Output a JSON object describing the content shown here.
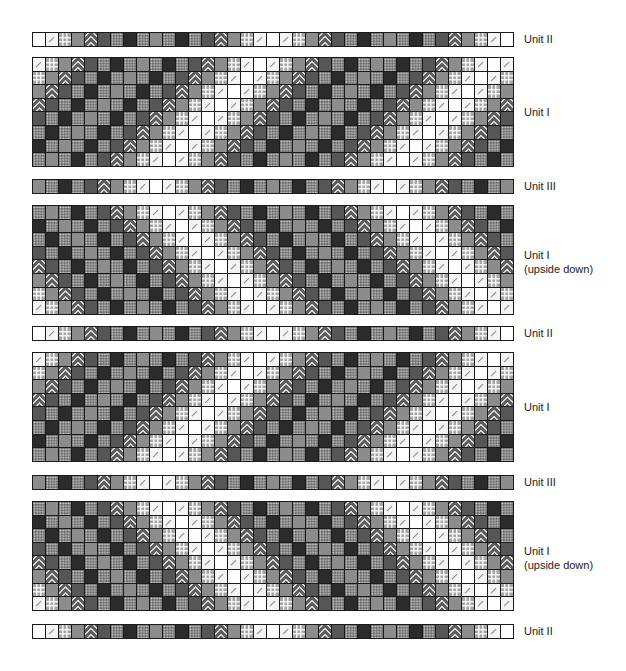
{
  "legend": {
    "W": "white",
    "D": "white-diagonal",
    "G": "light-gray-grid",
    "M": "medium-gray",
    "Z": "zigzag",
    "K": "dark-gray",
    "P": "dotted",
    "B": "black"
  },
  "colors": {
    "white": "#ffffff",
    "medium_gray": "#8c8c8c",
    "dark_gray": "#565656",
    "black": "#2b2b2b",
    "dotted_bg": "#6b6b6b",
    "border": "#1a1a1a"
  },
  "patterns": {
    "unit_ii": [
      [
        "W",
        "D",
        "G",
        "M",
        "Z",
        "K",
        "P",
        "B",
        "P",
        "M",
        "P",
        "B",
        "P",
        "K",
        "Z",
        "M",
        "G",
        "D",
        "W",
        "D",
        "G",
        "M",
        "Z",
        "K",
        "P",
        "B",
        "P",
        "M",
        "P",
        "B",
        "P",
        "K",
        "Z",
        "M",
        "G",
        "D",
        "W"
      ]
    ],
    "unit_iii": [
      [
        "M",
        "P",
        "B",
        "P",
        "K",
        "Z",
        "M",
        "G",
        "D",
        "W",
        "D",
        "G",
        "M",
        "Z",
        "K",
        "P",
        "B",
        "P",
        "M",
        "P",
        "B",
        "P",
        "K",
        "Z",
        "M",
        "G",
        "D",
        "W",
        "D",
        "G",
        "M",
        "Z",
        "K",
        "P",
        "B",
        "P",
        "M"
      ]
    ],
    "unit_i": [
      [
        "D",
        "G",
        "M",
        "Z",
        "K",
        "P",
        "B",
        "P",
        "M",
        "P",
        "B",
        "P",
        "K",
        "Z",
        "M",
        "G",
        "D",
        "W",
        "D",
        "G",
        "M",
        "Z",
        "K",
        "P",
        "B",
        "P",
        "M",
        "P",
        "B",
        "P",
        "K",
        "Z",
        "M",
        "G",
        "D",
        "W",
        "D"
      ],
      [
        "G",
        "M",
        "Z",
        "K",
        "P",
        "B",
        "P",
        "M",
        "P",
        "B",
        "P",
        "K",
        "Z",
        "M",
        "G",
        "D",
        "W",
        "D",
        "G",
        "M",
        "Z",
        "K",
        "P",
        "B",
        "P",
        "M",
        "P",
        "B",
        "P",
        "K",
        "Z",
        "M",
        "G",
        "D",
        "W",
        "D",
        "G"
      ],
      [
        "M",
        "Z",
        "K",
        "P",
        "B",
        "P",
        "M",
        "P",
        "B",
        "P",
        "K",
        "Z",
        "M",
        "G",
        "D",
        "W",
        "D",
        "G",
        "M",
        "Z",
        "K",
        "P",
        "B",
        "P",
        "M",
        "P",
        "B",
        "P",
        "K",
        "Z",
        "M",
        "G",
        "D",
        "W",
        "D",
        "G",
        "M"
      ],
      [
        "Z",
        "K",
        "P",
        "B",
        "P",
        "M",
        "P",
        "B",
        "P",
        "K",
        "Z",
        "M",
        "G",
        "D",
        "W",
        "D",
        "G",
        "M",
        "Z",
        "K",
        "P",
        "B",
        "P",
        "M",
        "P",
        "B",
        "P",
        "K",
        "Z",
        "M",
        "G",
        "D",
        "W",
        "D",
        "G",
        "M",
        "Z"
      ],
      [
        "K",
        "P",
        "B",
        "P",
        "M",
        "P",
        "B",
        "P",
        "K",
        "Z",
        "M",
        "G",
        "D",
        "W",
        "D",
        "G",
        "M",
        "Z",
        "K",
        "P",
        "B",
        "P",
        "M",
        "P",
        "B",
        "P",
        "K",
        "Z",
        "M",
        "G",
        "D",
        "W",
        "D",
        "G",
        "M",
        "Z",
        "K"
      ],
      [
        "P",
        "B",
        "P",
        "M",
        "P",
        "B",
        "P",
        "K",
        "Z",
        "M",
        "G",
        "D",
        "W",
        "D",
        "G",
        "M",
        "Z",
        "K",
        "P",
        "B",
        "P",
        "M",
        "P",
        "B",
        "P",
        "K",
        "Z",
        "M",
        "G",
        "D",
        "W",
        "D",
        "G",
        "M",
        "Z",
        "K",
        "P"
      ],
      [
        "B",
        "P",
        "M",
        "P",
        "B",
        "P",
        "K",
        "Z",
        "M",
        "G",
        "D",
        "W",
        "D",
        "G",
        "M",
        "Z",
        "K",
        "P",
        "B",
        "P",
        "M",
        "P",
        "B",
        "P",
        "K",
        "Z",
        "M",
        "G",
        "D",
        "W",
        "D",
        "G",
        "M",
        "Z",
        "K",
        "P",
        "B"
      ],
      [
        "P",
        "M",
        "P",
        "B",
        "P",
        "K",
        "Z",
        "M",
        "G",
        "D",
        "W",
        "D",
        "G",
        "M",
        "Z",
        "K",
        "P",
        "B",
        "P",
        "M",
        "P",
        "B",
        "P",
        "K",
        "Z",
        "M",
        "G",
        "D",
        "W",
        "D",
        "G",
        "M",
        "Z",
        "K",
        "P",
        "B",
        "P"
      ]
    ]
  },
  "blocks": [
    {
      "id": "b1",
      "pattern": "unit_ii",
      "flip": false,
      "top": 32,
      "label": "Unit II",
      "label_top": 32
    },
    {
      "id": "b2",
      "pattern": "unit_i",
      "flip": false,
      "top": 57,
      "label": "Unit I",
      "label_top": 105
    },
    {
      "id": "b3",
      "pattern": "unit_iii",
      "flip": false,
      "top": 179,
      "label": "Unit III",
      "label_top": 179
    },
    {
      "id": "b4",
      "pattern": "unit_i",
      "flip": true,
      "top": 205,
      "label": "Unit I\n(upside down)",
      "label_top": 248
    },
    {
      "id": "b5",
      "pattern": "unit_ii",
      "flip": false,
      "top": 326,
      "label": "Unit II",
      "label_top": 326
    },
    {
      "id": "b6",
      "pattern": "unit_i",
      "flip": false,
      "top": 352,
      "label": "Unit I",
      "label_top": 400
    },
    {
      "id": "b7",
      "pattern": "unit_iii",
      "flip": false,
      "top": 475,
      "label": "Unit III",
      "label_top": 475
    },
    {
      "id": "b8",
      "pattern": "unit_i",
      "flip": true,
      "top": 501,
      "label": "Unit I\n(upside down)",
      "label_top": 544
    },
    {
      "id": "b9",
      "pattern": "unit_ii",
      "flip": false,
      "top": 624,
      "label": "Unit II",
      "label_top": 624
    }
  ],
  "labels": {
    "unit_i": "Unit I",
    "unit_i_upside_down_line1": "Unit I",
    "unit_i_upside_down_line2": "(upside down)",
    "unit_ii": "Unit II",
    "unit_iii": "Unit III"
  }
}
